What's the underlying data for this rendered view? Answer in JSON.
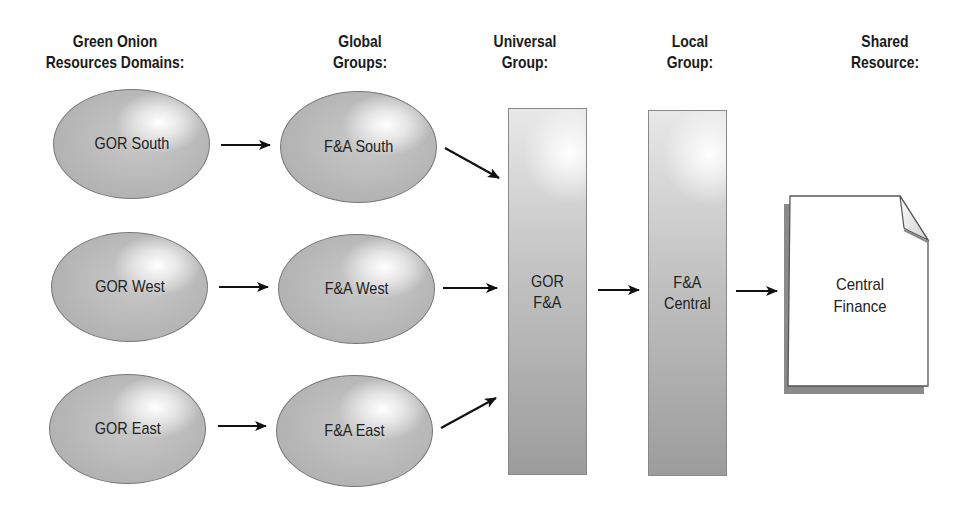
{
  "headers": {
    "domains": "Green Onion\nResources Domains:",
    "domains_line1": "Green Onion",
    "domains_line2": "Resources Domains:",
    "global_line1": "Global",
    "global_line2": "Groups:",
    "universal_line1": "Universal",
    "universal_line2": "Group:",
    "local_line1": "Local",
    "local_line2": "Group:",
    "shared_line1": "Shared",
    "shared_line2": "Resource:"
  },
  "domains": [
    {
      "label": "GOR South"
    },
    {
      "label": "GOR West"
    },
    {
      "label": "GOR East"
    }
  ],
  "global_groups": [
    {
      "label": "F&A South"
    },
    {
      "label": "F&A West"
    },
    {
      "label": "F&A East"
    }
  ],
  "universal_group": {
    "line1": "GOR",
    "line2": "F&A"
  },
  "local_group": {
    "line1": "F&A",
    "line2": "Central"
  },
  "shared_resource": {
    "line1": "Central",
    "line2": "Finance"
  },
  "icons": {
    "arrow": "right-arrow",
    "document": "document-folded-corner"
  },
  "colors": {
    "shape_fill": "#b5b5b5",
    "arrow": "#111111",
    "text": "#1a1a1a"
  }
}
